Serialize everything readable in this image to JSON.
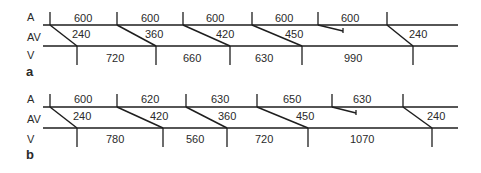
{
  "row_labels": {
    "atrium": "A",
    "av": "AV",
    "ventricle": "V"
  },
  "panels": [
    {
      "label": "a",
      "a_intervals": [
        "600",
        "600",
        "600",
        "600",
        "600"
      ],
      "av_intervals": [
        "240",
        "360",
        "420",
        "450",
        "240"
      ],
      "v_intervals": [
        "720",
        "660",
        "630",
        "990"
      ]
    },
    {
      "label": "b",
      "a_intervals": [
        "600",
        "620",
        "630",
        "650",
        "630"
      ],
      "av_intervals": [
        "240",
        "420",
        "360",
        "450",
        "240"
      ],
      "v_intervals": [
        "780",
        "560",
        "720",
        "1070"
      ]
    }
  ]
}
